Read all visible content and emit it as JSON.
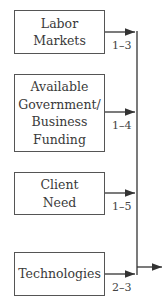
{
  "diagram": {
    "boxes": [
      {
        "label": "Labor\nMarkets",
        "range": "1–3"
      },
      {
        "label": "Available\nGovernment/\nBusiness\nFunding",
        "range": "1–4"
      },
      {
        "label": "Client\nNeed",
        "range": "1–5"
      },
      {
        "label": "Technologies",
        "range": "2–3"
      }
    ],
    "colors": {
      "line": "#333333",
      "border": "#555555",
      "text": "#3a3a3a"
    }
  }
}
